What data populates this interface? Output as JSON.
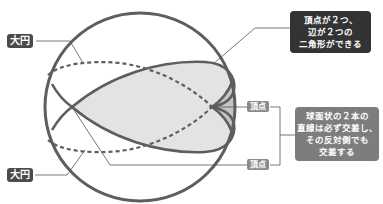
{
  "labels": {
    "great_circle_top": "大円",
    "great_circle_bottom": "大円",
    "vertex_top": "頂点",
    "vertex_bottom": "頂点"
  },
  "callouts": {
    "lune": {
      "lines": [
        "頂点が２つ、",
        "辺が２つの",
        "二角形ができる"
      ]
    },
    "intersection": {
      "lines": [
        "球面状の２本の",
        "直線は必ず交差し、",
        "その反対側でも",
        "交差する"
      ]
    }
  },
  "colors": {
    "sphere_stroke": "#5e5e5e",
    "lune_fill": "#e3e3e3",
    "small_lune_fill": "#c4c4c4",
    "dark_label": "#4a4a4a",
    "vertex_label": "#8a8a8a",
    "callout_dark": "#333333",
    "callout_gray": "#7d7d7d",
    "leader_line": "#555555"
  }
}
